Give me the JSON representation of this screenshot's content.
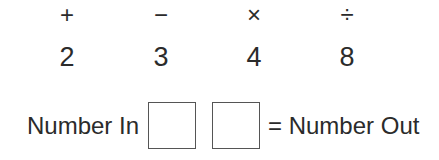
{
  "operations": [
    "+",
    "−",
    "×",
    "÷"
  ],
  "numbers": [
    "2",
    "3",
    "4",
    "8"
  ],
  "machine": {
    "input_label": "Number In",
    "output_label": "= Number Out",
    "box1_value": "",
    "box2_value": ""
  }
}
